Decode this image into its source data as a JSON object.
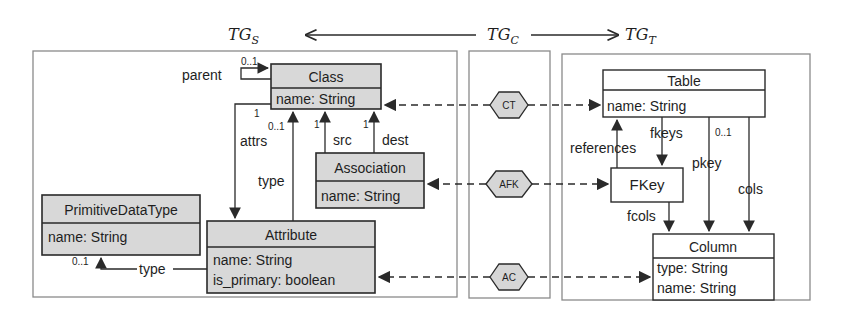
{
  "header": {
    "source_graph": "TG",
    "source_sub": "S",
    "correspondence_graph": "TG",
    "correspondence_sub": "C",
    "target_graph": "TG",
    "target_sub": "T"
  },
  "source_model": {
    "classes": [
      {
        "id": "class",
        "name": "Class",
        "attributes": [
          "name: String"
        ]
      },
      {
        "id": "association",
        "name": "Association",
        "attributes": [
          "name: String"
        ]
      },
      {
        "id": "primitive",
        "name": "PrimitiveDataType",
        "attributes": [
          "name: String"
        ]
      },
      {
        "id": "attribute",
        "name": "Attribute",
        "attributes": [
          "name: String",
          "is_primary: boolean"
        ]
      }
    ],
    "edges": {
      "parent": {
        "label": "parent",
        "mult": "0..1"
      },
      "attrs": {
        "label": "attrs",
        "mult": "1"
      },
      "attr_type_class": {
        "label": "type",
        "mult": "0..1"
      },
      "src": {
        "label": "src",
        "mult": "1"
      },
      "dest": {
        "label": "dest",
        "mult": "1"
      },
      "attr_type_primitive": {
        "label": "type",
        "mult": "0..1"
      }
    }
  },
  "correspondence": {
    "nodes": [
      {
        "id": "ct",
        "label": "CT"
      },
      {
        "id": "afk",
        "label": "AFK"
      },
      {
        "id": "ac",
        "label": "AC"
      }
    ]
  },
  "target_model": {
    "classes": [
      {
        "id": "table",
        "name": "Table",
        "attributes": [
          "name: String"
        ]
      },
      {
        "id": "fkey",
        "name": "FKey",
        "attributes": []
      },
      {
        "id": "column",
        "name": "Column",
        "attributes": [
          "type: String",
          "name: String"
        ]
      }
    ],
    "edges": {
      "fkeys": {
        "label": "fkeys"
      },
      "references": {
        "label": "references"
      },
      "pkey": {
        "label": "pkey",
        "mult": "0..1"
      },
      "cols": {
        "label": "cols"
      },
      "fcols": {
        "label": "fcols"
      }
    }
  },
  "colors": {
    "source_fill": "#d8d8d8",
    "target_fill": "#ffffff",
    "hex_fill": "#d6d6d6",
    "stroke": "#2a2a2a",
    "panel_stroke": "#8a8a8a"
  }
}
